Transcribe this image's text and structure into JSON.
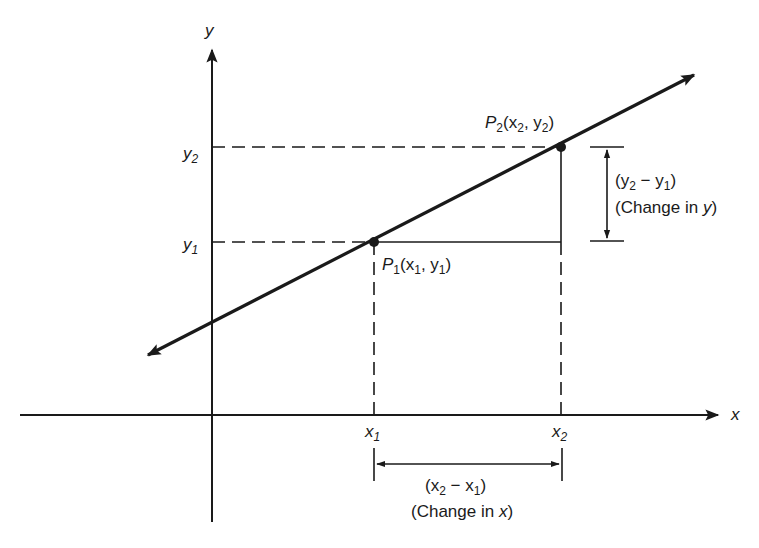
{
  "diagram": {
    "type": "slope-of-line",
    "colors": {
      "ink": "#1a1a1a",
      "background": "#ffffff"
    },
    "axes": {
      "x_label": "x",
      "y_label": "y"
    },
    "ticks": {
      "x1": {
        "base": "x",
        "sub": "1"
      },
      "x2": {
        "base": "x",
        "sub": "2"
      },
      "y1": {
        "base": "y",
        "sub": "1"
      },
      "y2": {
        "base": "y",
        "sub": "2"
      }
    },
    "points": {
      "p1": {
        "name": "P",
        "sub": "1",
        "coords_open": "(x",
        "c1sub": "1",
        "sep": ", y",
        "c2sub": "1",
        "close": ")"
      },
      "p2": {
        "name": "P",
        "sub": "2",
        "coords_open": "(x",
        "c1sub": "2",
        "sep": ", y",
        "c2sub": "2",
        "close": ")"
      }
    },
    "delta_y": {
      "expr_open": "(y",
      "expr_sub_a": "2",
      "expr_mid": " − y",
      "expr_sub_b": "1",
      "expr_close": ")",
      "caption_prefix": "(Change in ",
      "caption_var": "y",
      "caption_suffix": ")"
    },
    "delta_x": {
      "expr_open": "(x",
      "expr_sub_a": "2",
      "expr_mid": " − x",
      "expr_sub_b": "1",
      "expr_close": ")",
      "caption_prefix": "(Change in ",
      "caption_var": "x",
      "caption_suffix": ")"
    }
  }
}
